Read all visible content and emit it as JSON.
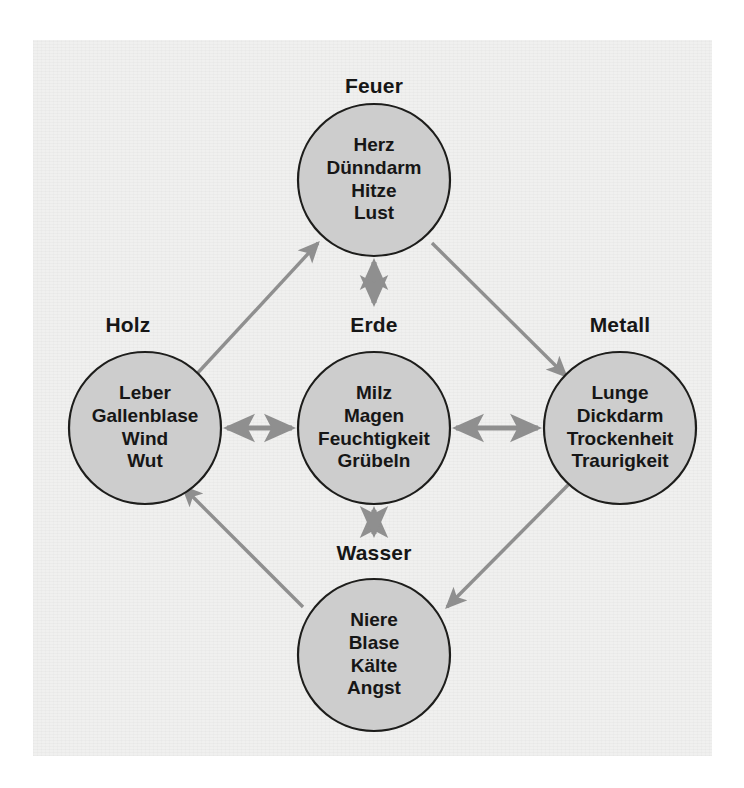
{
  "diagram": {
    "background_color": "#f0f0ef",
    "circle_fill": "#cdcdcd",
    "circle_stroke": "#1d1d1b",
    "arrow_color": "#8f8f8f",
    "nodes": [
      {
        "id": "feuer",
        "label": "Feuer",
        "items": [
          "Herz",
          "Dünndarm",
          "Hitze",
          "Lust"
        ],
        "cx": 374,
        "cy": 180,
        "r": 76,
        "label_x": 374,
        "label_y": 74
      },
      {
        "id": "holz",
        "label": "Holz",
        "items": [
          "Leber",
          "Gallenblase",
          "Wind",
          "Wut"
        ],
        "cx": 145,
        "cy": 428,
        "r": 76,
        "label_x": 128,
        "label_y": 313
      },
      {
        "id": "erde",
        "label": "Erde",
        "items": [
          "Milz",
          "Magen",
          "Feuchtigkeit",
          "Grübeln"
        ],
        "cx": 374,
        "cy": 428,
        "r": 76,
        "label_x": 374,
        "label_y": 313
      },
      {
        "id": "metall",
        "label": "Metall",
        "items": [
          "Lunge",
          "Dickdarm",
          "Trockenheit",
          "Traurigkeit"
        ],
        "cx": 620,
        "cy": 428,
        "r": 76,
        "label_x": 620,
        "label_y": 313
      },
      {
        "id": "wasser",
        "label": "Wasser",
        "items": [
          "Niere",
          "Blase",
          "Kälte",
          "Angst"
        ],
        "cx": 374,
        "cy": 655,
        "r": 76,
        "label_x": 374,
        "label_y": 541
      }
    ],
    "arrows": [
      {
        "id": "holz-to-feuer",
        "from": "holz",
        "to": "feuer",
        "heads": "single",
        "x1": 194,
        "y1": 377,
        "x2": 318,
        "y2": 243
      },
      {
        "id": "feuer-to-metall",
        "from": "feuer",
        "to": "metall",
        "heads": "single",
        "x1": 432,
        "y1": 243,
        "x2": 566,
        "y2": 376
      },
      {
        "id": "metall-to-wasser",
        "from": "metall",
        "to": "wasser",
        "heads": "single",
        "x1": 571,
        "y1": 482,
        "x2": 447,
        "y2": 607
      },
      {
        "id": "wasser-to-holz",
        "from": "wasser",
        "to": "holz",
        "heads": "single",
        "x1": 303,
        "y1": 607,
        "x2": 183,
        "y2": 487
      },
      {
        "id": "feuer-erde",
        "from": "feuer",
        "to": "erde",
        "heads": "double",
        "x1": 374,
        "y1": 262,
        "x2": 374,
        "y2": 303
      },
      {
        "id": "holz-erde",
        "from": "holz",
        "to": "erde",
        "heads": "double",
        "x1": 227,
        "y1": 428,
        "x2": 292,
        "y2": 428
      },
      {
        "id": "erde-metall",
        "from": "erde",
        "to": "metall",
        "heads": "double",
        "x1": 456,
        "y1": 428,
        "x2": 538,
        "y2": 428
      },
      {
        "id": "erde-wasser",
        "from": "erde",
        "to": "wasser",
        "heads": "double",
        "x1": 374,
        "y1": 510,
        "x2": 374,
        "y2": 534
      }
    ]
  }
}
